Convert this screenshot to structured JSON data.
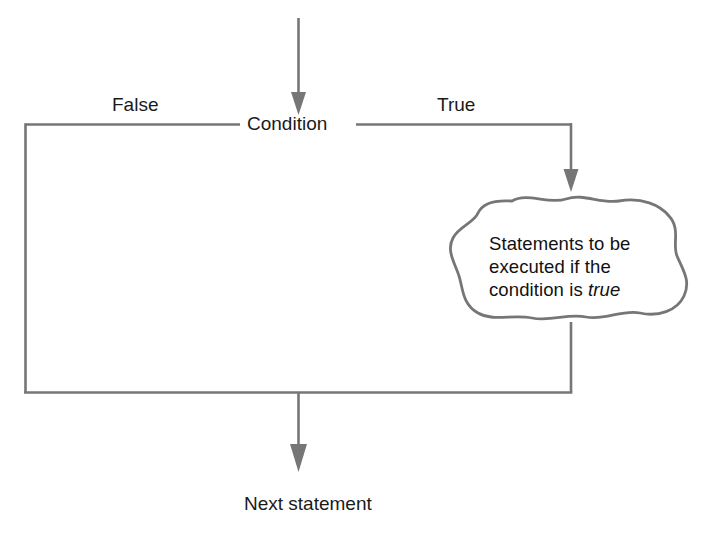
{
  "diagram": {
    "type": "flowchart",
    "colors": {
      "stroke": "#767676",
      "text": "#1a1a1a",
      "background": "#ffffff"
    },
    "nodes": {
      "condition": {
        "label": "Condition",
        "shape": "inline-text-decision"
      },
      "statements": {
        "shape": "cloud",
        "line1": "Statements to be",
        "line2": "executed if the",
        "line3_prefix": "condition is ",
        "line3_emphasis": "true",
        "full_text": "Statements to be executed if the condition is true"
      },
      "next_statement": {
        "label": "Next statement",
        "shape": "inline-text"
      }
    },
    "branches": {
      "false_label": "False",
      "true_label": "True"
    },
    "arrows": {
      "entry": "arrow-into-condition",
      "true_branch": "arrow-into-statements-cloud",
      "exit": "arrow-into-next-statement"
    }
  }
}
